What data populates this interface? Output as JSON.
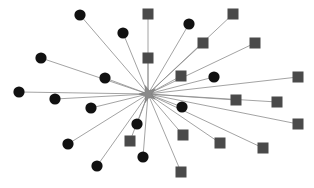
{
  "figure": {
    "title": "",
    "kind": "star-network-graph",
    "width": 314,
    "height": 188,
    "background_color": "#ffffff"
  },
  "palette": {
    "circle_node_color": "#111111",
    "square_node_color": "#4a4a4a",
    "edge_color": "#8c8c8c",
    "hub_fill": "#8a8a8a",
    "hub_stroke": "#6f6f6f"
  },
  "chart_data": {
    "type": "scatter",
    "title": "",
    "xlabel": "",
    "ylabel": "",
    "xlim": [
      0,
      314
    ],
    "ylim": [
      0,
      188
    ],
    "grid": false,
    "legend_position": "none",
    "layout": "hub-and-spoke",
    "hub": {
      "id": "hub",
      "label": "hub",
      "shape": "star",
      "x": 148,
      "y": 94,
      "outer_radius": 9,
      "inner_radius": 3.6,
      "points": 5,
      "rotation_deg": -18,
      "color": "#8a8a8a"
    },
    "node_shapes": [
      "circle",
      "square"
    ],
    "circle_radius": 5.6,
    "square_size": 11,
    "nodes": [
      {
        "id": "c1",
        "shape": "circle",
        "x": 80,
        "y": 15
      },
      {
        "id": "c2",
        "shape": "circle",
        "x": 123,
        "y": 33
      },
      {
        "id": "c3",
        "shape": "circle",
        "x": 189,
        "y": 24
      },
      {
        "id": "c4",
        "shape": "circle",
        "x": 41,
        "y": 58
      },
      {
        "id": "c5",
        "shape": "circle",
        "x": 105,
        "y": 78
      },
      {
        "id": "c6",
        "shape": "circle",
        "x": 214,
        "y": 77
      },
      {
        "id": "c7",
        "shape": "circle",
        "x": 19,
        "y": 92
      },
      {
        "id": "c8",
        "shape": "circle",
        "x": 55,
        "y": 99
      },
      {
        "id": "c9",
        "shape": "circle",
        "x": 91,
        "y": 108
      },
      {
        "id": "c10",
        "shape": "circle",
        "x": 182,
        "y": 107
      },
      {
        "id": "c11",
        "shape": "circle",
        "x": 137,
        "y": 124
      },
      {
        "id": "c12",
        "shape": "circle",
        "x": 68,
        "y": 144
      },
      {
        "id": "c13",
        "shape": "circle",
        "x": 143,
        "y": 157
      },
      {
        "id": "c14",
        "shape": "circle",
        "x": 97,
        "y": 166
      },
      {
        "id": "s1",
        "shape": "square",
        "x": 148,
        "y": 14
      },
      {
        "id": "s2",
        "shape": "square",
        "x": 233,
        "y": 14
      },
      {
        "id": "s3",
        "shape": "square",
        "x": 203,
        "y": 43
      },
      {
        "id": "s4",
        "shape": "square",
        "x": 255,
        "y": 43
      },
      {
        "id": "s5",
        "shape": "square",
        "x": 148,
        "y": 58
      },
      {
        "id": "s6",
        "shape": "square",
        "x": 181,
        "y": 76
      },
      {
        "id": "s7",
        "shape": "square",
        "x": 298,
        "y": 77
      },
      {
        "id": "s8",
        "shape": "square",
        "x": 236,
        "y": 100
      },
      {
        "id": "s9",
        "shape": "square",
        "x": 277,
        "y": 102
      },
      {
        "id": "s10",
        "shape": "square",
        "x": 298,
        "y": 124
      },
      {
        "id": "s11",
        "shape": "square",
        "x": 130,
        "y": 141
      },
      {
        "id": "s12",
        "shape": "square",
        "x": 183,
        "y": 135
      },
      {
        "id": "s13",
        "shape": "square",
        "x": 220,
        "y": 143
      },
      {
        "id": "s14",
        "shape": "square",
        "x": 263,
        "y": 148
      },
      {
        "id": "s15",
        "shape": "square",
        "x": 181,
        "y": 172
      }
    ],
    "edges": [
      {
        "source": "hub",
        "target": "c1"
      },
      {
        "source": "hub",
        "target": "c2"
      },
      {
        "source": "hub",
        "target": "c3"
      },
      {
        "source": "hub",
        "target": "c4"
      },
      {
        "source": "hub",
        "target": "c5"
      },
      {
        "source": "hub",
        "target": "c6"
      },
      {
        "source": "hub",
        "target": "c7"
      },
      {
        "source": "hub",
        "target": "c8"
      },
      {
        "source": "hub",
        "target": "c9"
      },
      {
        "source": "hub",
        "target": "c10"
      },
      {
        "source": "hub",
        "target": "c11"
      },
      {
        "source": "hub",
        "target": "c12"
      },
      {
        "source": "hub",
        "target": "c13"
      },
      {
        "source": "hub",
        "target": "c14"
      },
      {
        "source": "hub",
        "target": "s1"
      },
      {
        "source": "hub",
        "target": "s2"
      },
      {
        "source": "hub",
        "target": "s3"
      },
      {
        "source": "hub",
        "target": "s4"
      },
      {
        "source": "hub",
        "target": "s5"
      },
      {
        "source": "hub",
        "target": "s6"
      },
      {
        "source": "hub",
        "target": "s7"
      },
      {
        "source": "hub",
        "target": "s8"
      },
      {
        "source": "hub",
        "target": "s9"
      },
      {
        "source": "hub",
        "target": "s10"
      },
      {
        "source": "hub",
        "target": "s11"
      },
      {
        "source": "hub",
        "target": "s12"
      },
      {
        "source": "hub",
        "target": "s13"
      },
      {
        "source": "hub",
        "target": "s14"
      },
      {
        "source": "hub",
        "target": "s15"
      }
    ],
    "counts": {
      "circle_nodes": 14,
      "square_nodes": 15,
      "total_nodes": 29,
      "edges": 29
    }
  }
}
